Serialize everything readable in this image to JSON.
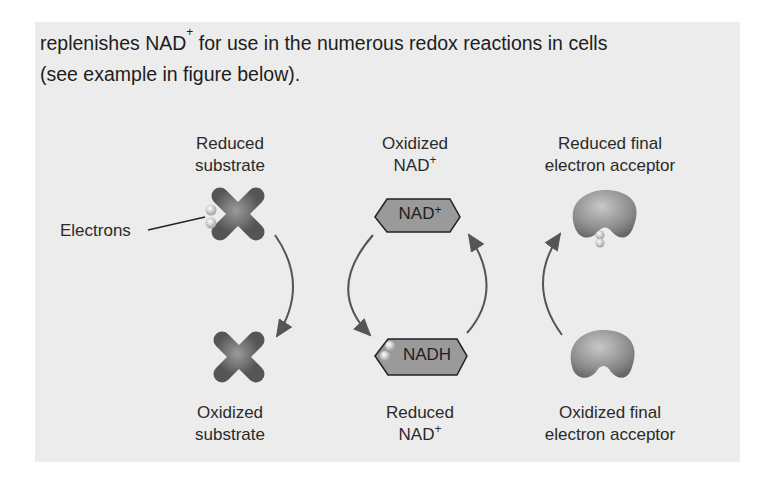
{
  "intro": {
    "line1_pre": "replenishes NAD",
    "line1_sup": "+",
    "line1_post": " for use in the numerous redox reactions in cells",
    "line2": "(see example in figure below)."
  },
  "figure": {
    "electrons_label": "Electrons",
    "top": {
      "substrate": {
        "line1": "Reduced",
        "line2": "substrate"
      },
      "nad": {
        "line1": "Oxidized",
        "line2": "NAD",
        "sup": "+"
      },
      "acceptor": {
        "line1": "Reduced final",
        "line2": "electron acceptor"
      }
    },
    "bottom": {
      "substrate": {
        "line1": "Oxidized",
        "line2": "substrate"
      },
      "nad": {
        "line1": "Reduced",
        "line2": "NAD",
        "sup": "+"
      },
      "acceptor": {
        "line1": "Oxidized final",
        "line2": "electron acceptor"
      }
    },
    "hex_top": {
      "text": "NAD",
      "sup": "+"
    },
    "hex_bottom": {
      "text": "NADH"
    },
    "colors": {
      "panel": "#ececec",
      "molecule": "#6f6f6f",
      "hexagon_fill": "#9a9a9a",
      "arrow": "#555555"
    }
  }
}
